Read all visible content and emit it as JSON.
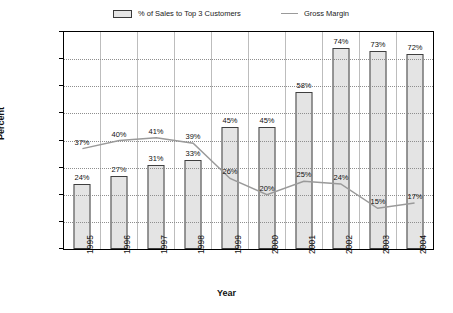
{
  "chart_data": {
    "type": "bar",
    "title": "",
    "xlabel": "Year",
    "ylabel": "Percent",
    "categories": [
      "1995",
      "1996",
      "1997",
      "1998",
      "1999",
      "2000",
      "2001",
      "2002",
      "2003",
      "2004"
    ],
    "ylim": [
      0,
      80
    ],
    "ytick_labels": [
      "0.0%",
      "10.0%",
      "20.0%",
      "30.0%",
      "40.0%",
      "50.0%",
      "60.0%",
      "70.0%",
      "80.0%"
    ],
    "ytick_values": [
      0,
      10,
      20,
      30,
      40,
      50,
      60,
      70,
      80
    ],
    "grid": true,
    "legend_position": "top",
    "series": [
      {
        "name": "% of Sales to Top 3 Customers",
        "type": "bar",
        "values": [
          24,
          27,
          31,
          33,
          45,
          45,
          58,
          74,
          73,
          72
        ],
        "data_labels": [
          "24%",
          "27%",
          "31%",
          "33%",
          "45%",
          "45%",
          "58%",
          "74%",
          "73%",
          "72%"
        ],
        "color": "#e4e4e4",
        "border_color": "#3f3f3f"
      },
      {
        "name": "Gross Margin",
        "type": "line",
        "values": [
          37,
          40,
          41,
          39,
          26,
          20,
          25,
          24,
          15,
          17
        ],
        "data_labels": [
          "37%",
          "40%",
          "41%",
          "39%",
          "26%",
          "20%",
          "25%",
          "24%",
          "15%",
          "17%"
        ],
        "color": "#9a9a9a"
      }
    ]
  },
  "legend": {
    "bars_label": "% of Sales to Top 3 Customers",
    "line_label": "Gross Margin"
  },
  "axes": {
    "y_title": "Percent",
    "x_title": "Year"
  }
}
